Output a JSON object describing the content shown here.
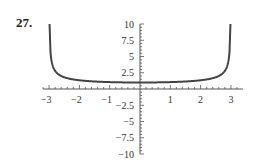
{
  "problem": {
    "number": "27."
  },
  "chart_data": {
    "type": "line",
    "title": "",
    "xlabel": "",
    "ylabel": "",
    "function": "y = 3/sqrt(9 - x^2)",
    "xlim": [
      -3.2,
      3.2
    ],
    "ylim": [
      -10,
      10
    ],
    "x_ticks": [
      -3,
      -2,
      -1,
      1,
      2,
      3
    ],
    "x_tick_labels": [
      "−3",
      "−2",
      "−1",
      "1",
      "2",
      "3"
    ],
    "y_ticks": [
      10,
      7.5,
      5,
      2.5,
      -2.5,
      -5,
      -7.5,
      -10
    ],
    "y_tick_labels": [
      "10",
      "7.5",
      "5",
      "2.5",
      "−2.5",
      "−5",
      "−7.5",
      "−10"
    ],
    "vertical_asymptotes": [
      -3,
      3
    ],
    "series": [
      {
        "name": "f(x)",
        "x": [
          -2.955,
          -2.9,
          -2.8,
          -2.6,
          -2.4,
          -2.0,
          -1.5,
          -1.0,
          -0.5,
          0,
          0.5,
          1.0,
          1.5,
          2.0,
          2.4,
          2.6,
          2.8,
          2.9,
          2.955
        ],
        "values": [
          5.8,
          3.9,
          2.78,
          2.0,
          1.67,
          1.34,
          1.15,
          1.06,
          1.01,
          1.0,
          1.01,
          1.06,
          1.15,
          1.34,
          1.67,
          2.0,
          2.78,
          3.9,
          5.8
        ]
      }
    ],
    "grid": false,
    "legend": null,
    "curve_color": "#444444",
    "axis_color": "#555555"
  }
}
